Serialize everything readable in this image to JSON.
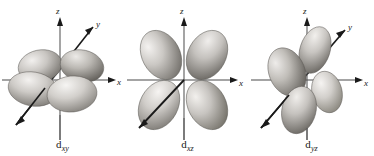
{
  "figure": {
    "background_color": "#ffffff",
    "ink_color": "#1a1a1a",
    "width": 374,
    "height": 156,
    "caption": ""
  },
  "orbitals": [
    {
      "id": "d-xy",
      "symbol": "d",
      "subscript": "xy",
      "label_text": "dxy",
      "plane": "xy",
      "lobe_count": 4,
      "view": "perspective-from-above",
      "axes": [
        {
          "name": "z-axis",
          "letter": "z",
          "direction": "up",
          "arrow": true
        },
        {
          "name": "x-axis",
          "letter": "x",
          "direction": "right",
          "arrow": true
        },
        {
          "name": "y-axis",
          "letter": "y",
          "direction": "upper-right-diagonal",
          "arrow": true
        }
      ],
      "lobe_fill_light": "#e8e6e3",
      "lobe_fill_dark": "#6b6864"
    },
    {
      "id": "d-xz",
      "symbol": "d",
      "subscript": "xz",
      "label_text": "dxz",
      "plane": "xz",
      "lobe_count": 4,
      "view": "face-on",
      "axes": [
        {
          "name": "z-axis",
          "letter": "z",
          "direction": "up",
          "arrow": true
        },
        {
          "name": "x-axis",
          "letter": "x",
          "direction": "right",
          "arrow": true
        },
        {
          "name": "y-axis",
          "letter": "",
          "direction": "lower-left-diagonal",
          "arrow": false
        }
      ],
      "lobe_fill_light": "#eceae7",
      "lobe_fill_dark": "#706d69"
    },
    {
      "id": "d-yz",
      "symbol": "d",
      "subscript": "yz",
      "label_text": "dyz",
      "plane": "yz",
      "lobe_count": 4,
      "view": "perspective-from-right",
      "axes": [
        {
          "name": "z-axis",
          "letter": "z",
          "direction": "up",
          "arrow": true
        },
        {
          "name": "x-axis",
          "letter": "x",
          "direction": "right",
          "arrow": true
        },
        {
          "name": "y-axis",
          "letter": "y",
          "direction": "upper-right-diagonal",
          "arrow": true
        }
      ],
      "lobe_fill_light": "#e6e4e1",
      "lobe_fill_dark": "#68655f"
    }
  ]
}
